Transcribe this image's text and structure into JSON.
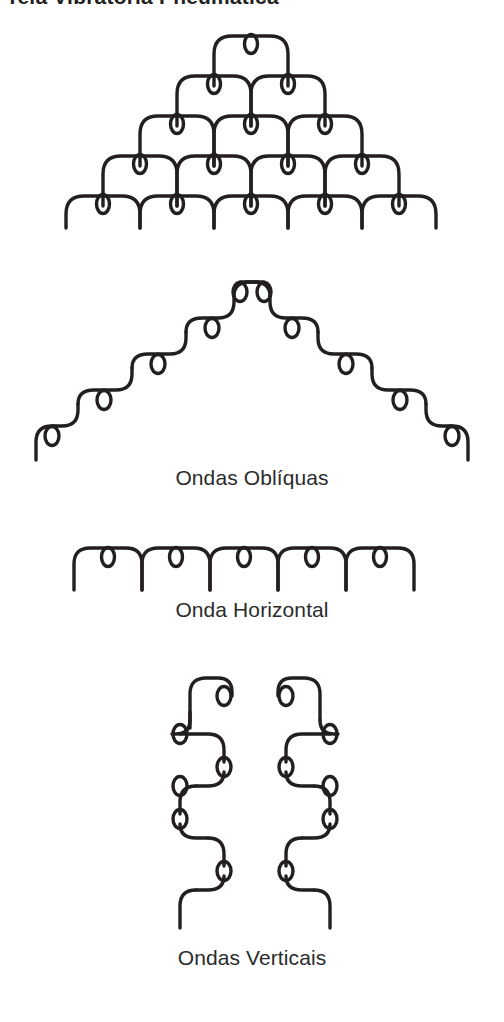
{
  "header": {
    "title": "Tela Vibratória Pneumática"
  },
  "figures": [
    {
      "id": "pyramid",
      "name": "pyramid-wave-diagram",
      "caption": "",
      "rows": 5,
      "arches_per_row": [
        1,
        2,
        3,
        4,
        5
      ],
      "loops_total": 15
    },
    {
      "id": "oblique",
      "name": "oblique-waves-diagram",
      "caption": "Ondas Oblíquas",
      "chains": 2,
      "steps_per_chain": 5
    },
    {
      "id": "horizontal",
      "name": "horizontal-wave-diagram",
      "caption": "Onda Horizontal",
      "arches": 5,
      "loops": 5
    },
    {
      "id": "vertical",
      "name": "vertical-waves-diagram",
      "caption": "Ondas Verticais",
      "columns": 2,
      "steps_per_column": 6
    }
  ],
  "captions": {
    "oblique": "Ondas Oblíquas",
    "horizontal": "Onda Horizontal",
    "vertical": "Ondas Verticais"
  },
  "style": {
    "stroke_color": "#231f20",
    "background_color": "#ffffff",
    "text_color": "#2b2b2b"
  }
}
